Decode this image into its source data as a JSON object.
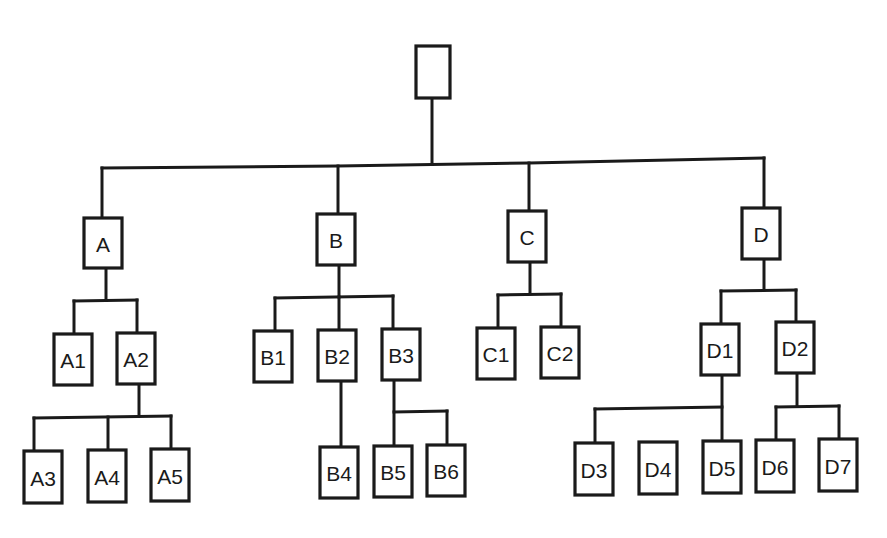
{
  "diagram": {
    "type": "tree",
    "colors": {
      "stroke": "#1a1a1a",
      "background": "#ffffff",
      "box_fill": "#ffffff"
    },
    "nodes": [
      {
        "id": "root",
        "label": "",
        "x": 416,
        "y": 46,
        "w": 34,
        "h": 52
      },
      {
        "id": "A",
        "label": "A",
        "x": 84,
        "y": 218,
        "w": 38,
        "h": 50
      },
      {
        "id": "B",
        "label": "B",
        "x": 317,
        "y": 214,
        "w": 38,
        "h": 51
      },
      {
        "id": "C",
        "label": "C",
        "x": 508,
        "y": 211,
        "w": 38,
        "h": 51
      },
      {
        "id": "D",
        "label": "D",
        "x": 742,
        "y": 208,
        "w": 38,
        "h": 51
      },
      {
        "id": "A1",
        "label": "A1",
        "x": 54,
        "y": 334,
        "w": 38,
        "h": 51
      },
      {
        "id": "A2",
        "label": "A2",
        "x": 117,
        "y": 333,
        "w": 38,
        "h": 51
      },
      {
        "id": "B1",
        "label": "B1",
        "x": 254,
        "y": 331,
        "w": 38,
        "h": 51
      },
      {
        "id": "B2",
        "label": "B2",
        "x": 318,
        "y": 330,
        "w": 38,
        "h": 51
      },
      {
        "id": "B3",
        "label": "B3",
        "x": 382,
        "y": 329,
        "w": 38,
        "h": 51
      },
      {
        "id": "C1",
        "label": "C1",
        "x": 477,
        "y": 328,
        "w": 38,
        "h": 51
      },
      {
        "id": "C2",
        "label": "C2",
        "x": 541,
        "y": 327,
        "w": 38,
        "h": 51
      },
      {
        "id": "D1",
        "label": "D1",
        "x": 701,
        "y": 324,
        "w": 38,
        "h": 51
      },
      {
        "id": "D2",
        "label": "D2",
        "x": 776,
        "y": 322,
        "w": 38,
        "h": 51
      },
      {
        "id": "A3",
        "label": "A3",
        "x": 24,
        "y": 451,
        "w": 38,
        "h": 52
      },
      {
        "id": "A4",
        "label": "A4",
        "x": 88,
        "y": 450,
        "w": 38,
        "h": 52
      },
      {
        "id": "A5",
        "label": "A5",
        "x": 151,
        "y": 449,
        "w": 38,
        "h": 52
      },
      {
        "id": "B4",
        "label": "B4",
        "x": 320,
        "y": 447,
        "w": 38,
        "h": 51
      },
      {
        "id": "B5",
        "label": "B5",
        "x": 374,
        "y": 446,
        "w": 38,
        "h": 51
      },
      {
        "id": "B6",
        "label": "B6",
        "x": 427,
        "y": 445,
        "w": 38,
        "h": 51
      },
      {
        "id": "D3",
        "label": "D3",
        "x": 575,
        "y": 443,
        "w": 38,
        "h": 52
      },
      {
        "id": "D4",
        "label": "D4",
        "x": 639,
        "y": 442,
        "w": 38,
        "h": 52
      },
      {
        "id": "D5",
        "label": "D5",
        "x": 703,
        "y": 441,
        "w": 38,
        "h": 52
      },
      {
        "id": "D6",
        "label": "D6",
        "x": 756,
        "y": 440,
        "w": 38,
        "h": 52
      },
      {
        "id": "D7",
        "label": "D7",
        "x": 819,
        "y": 439,
        "w": 38,
        "h": 52
      }
    ],
    "edges": [
      {
        "id": "root-trunk",
        "points": [
          [
            432,
            98
          ],
          [
            432,
            162
          ]
        ]
      },
      {
        "id": "level1-bar",
        "points": [
          [
            102,
            168
          ],
          [
            338,
            166
          ],
          [
            529,
            163
          ],
          [
            764,
            158
          ]
        ]
      },
      {
        "id": "to-A",
        "points": [
          [
            102,
            168
          ],
          [
            102,
            218
          ]
        ]
      },
      {
        "id": "to-B",
        "points": [
          [
            338,
            166
          ],
          [
            338,
            214
          ]
        ]
      },
      {
        "id": "to-C",
        "points": [
          [
            529,
            163
          ],
          [
            529,
            211
          ]
        ]
      },
      {
        "id": "to-D",
        "points": [
          [
            764,
            158
          ],
          [
            764,
            208
          ]
        ]
      },
      {
        "id": "A-trunk",
        "points": [
          [
            106,
            268
          ],
          [
            106,
            300
          ]
        ]
      },
      {
        "id": "A-bar",
        "points": [
          [
            74,
            301
          ],
          [
            137,
            300
          ]
        ]
      },
      {
        "id": "to-A1",
        "points": [
          [
            74,
            301
          ],
          [
            74,
            334
          ]
        ]
      },
      {
        "id": "to-A2",
        "points": [
          [
            137,
            300
          ],
          [
            137,
            333
          ]
        ]
      },
      {
        "id": "A2-trunk",
        "points": [
          [
            139,
            384
          ],
          [
            139,
            416
          ]
        ]
      },
      {
        "id": "A2-bar",
        "points": [
          [
            34,
            418
          ],
          [
            171,
            416
          ]
        ]
      },
      {
        "id": "to-A3",
        "points": [
          [
            34,
            418
          ],
          [
            34,
            451
          ]
        ]
      },
      {
        "id": "to-A4",
        "points": [
          [
            108,
            417
          ],
          [
            108,
            450
          ]
        ]
      },
      {
        "id": "to-A5",
        "points": [
          [
            171,
            416
          ],
          [
            171,
            449
          ]
        ]
      },
      {
        "id": "B-trunk",
        "points": [
          [
            339,
            265
          ],
          [
            339,
            297
          ]
        ]
      },
      {
        "id": "B-bar",
        "points": [
          [
            275,
            298
          ],
          [
            393,
            296
          ]
        ]
      },
      {
        "id": "to-B1",
        "points": [
          [
            275,
            298
          ],
          [
            275,
            331
          ]
        ]
      },
      {
        "id": "to-B2",
        "points": [
          [
            339,
            297
          ],
          [
            339,
            330
          ]
        ]
      },
      {
        "id": "to-B3",
        "points": [
          [
            393,
            296
          ],
          [
            393,
            329
          ]
        ]
      },
      {
        "id": "B2-to-B4",
        "points": [
          [
            341,
            381
          ],
          [
            341,
            447
          ]
        ]
      },
      {
        "id": "B3-trunk",
        "points": [
          [
            394,
            380
          ],
          [
            394,
            446
          ]
        ]
      },
      {
        "id": "B3-bar",
        "points": [
          [
            394,
            412
          ],
          [
            447,
            411
          ]
        ]
      },
      {
        "id": "to-B6",
        "points": [
          [
            447,
            411
          ],
          [
            447,
            445
          ]
        ]
      },
      {
        "id": "C-trunk",
        "points": [
          [
            530,
            262
          ],
          [
            530,
            294
          ]
        ]
      },
      {
        "id": "C-bar",
        "points": [
          [
            498,
            295
          ],
          [
            561,
            294
          ]
        ]
      },
      {
        "id": "to-C1",
        "points": [
          [
            498,
            295
          ],
          [
            498,
            328
          ]
        ]
      },
      {
        "id": "to-C2",
        "points": [
          [
            561,
            294
          ],
          [
            561,
            327
          ]
        ]
      },
      {
        "id": "D-trunk",
        "points": [
          [
            764,
            259
          ],
          [
            764,
            290
          ]
        ]
      },
      {
        "id": "D-bar",
        "points": [
          [
            721,
            291
          ],
          [
            796,
            290
          ]
        ]
      },
      {
        "id": "to-D1",
        "points": [
          [
            721,
            291
          ],
          [
            721,
            324
          ]
        ]
      },
      {
        "id": "to-D2",
        "points": [
          [
            796,
            290
          ],
          [
            796,
            322
          ]
        ]
      },
      {
        "id": "D1-trunk",
        "points": [
          [
            722,
            375
          ],
          [
            722,
            441
          ]
        ]
      },
      {
        "id": "D1-bar",
        "points": [
          [
            595,
            409
          ],
          [
            722,
            407
          ]
        ]
      },
      {
        "id": "to-D3",
        "points": [
          [
            595,
            409
          ],
          [
            595,
            443
          ]
        ]
      },
      {
        "id": "D2-trunk",
        "points": [
          [
            797,
            373
          ],
          [
            797,
            406
          ]
        ]
      },
      {
        "id": "D2-bar",
        "points": [
          [
            776,
            407
          ],
          [
            839,
            406
          ]
        ]
      },
      {
        "id": "to-D6",
        "points": [
          [
            776,
            407
          ],
          [
            776,
            440
          ]
        ]
      },
      {
        "id": "to-D7",
        "points": [
          [
            839,
            406
          ],
          [
            839,
            439
          ]
        ]
      }
    ]
  }
}
